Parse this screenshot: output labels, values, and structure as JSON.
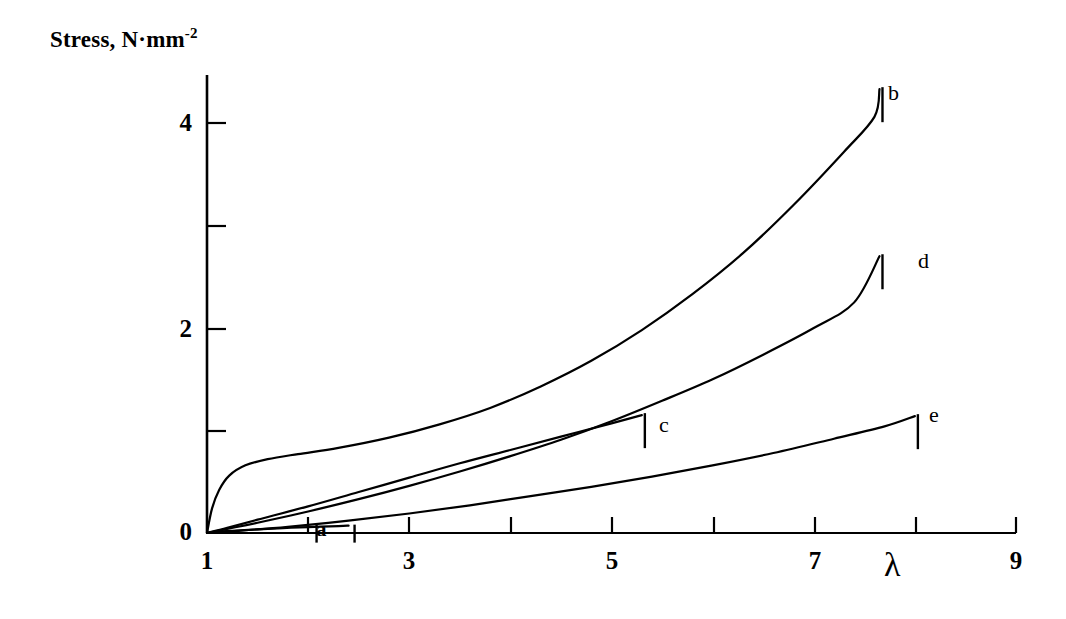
{
  "chart_data": {
    "type": "line",
    "title": "",
    "ylabel": "Stress, N·mm",
    "ylabel_sup": "-2",
    "xlabel": "λ",
    "xlim": [
      1,
      9
    ],
    "ylim": [
      0,
      4.6
    ],
    "grid": false,
    "legend_position": "inline-end-of-curve",
    "x_ticks_major": [
      1,
      3,
      5,
      7,
      9
    ],
    "x_ticks_major_labels": [
      "1",
      "3",
      "5",
      "7",
      "9"
    ],
    "x_ticks_minor": [
      2,
      4,
      6,
      8
    ],
    "y_ticks_major": [
      0,
      2,
      4
    ],
    "y_ticks_major_labels": [
      "0",
      "2",
      "4"
    ],
    "y_ticks_minor": [
      1,
      3
    ],
    "series": [
      {
        "name": "a",
        "label": "a",
        "label_style": "bracketed",
        "points": [
          [
            1.0,
            0.0
          ],
          [
            1.1,
            0.012
          ],
          [
            1.25,
            0.022
          ],
          [
            1.5,
            0.036
          ],
          [
            1.75,
            0.048
          ],
          [
            2.0,
            0.058
          ],
          [
            2.3,
            0.068
          ],
          [
            2.4,
            0.072
          ]
        ]
      },
      {
        "name": "b",
        "label": "b",
        "label_style": "tick",
        "points": [
          [
            1.0,
            0.0
          ],
          [
            1.05,
            0.24
          ],
          [
            1.12,
            0.42
          ],
          [
            1.22,
            0.56
          ],
          [
            1.38,
            0.66
          ],
          [
            1.6,
            0.72
          ],
          [
            1.9,
            0.77
          ],
          [
            2.3,
            0.83
          ],
          [
            2.8,
            0.93
          ],
          [
            3.3,
            1.06
          ],
          [
            3.8,
            1.22
          ],
          [
            4.3,
            1.43
          ],
          [
            4.8,
            1.68
          ],
          [
            5.3,
            1.98
          ],
          [
            5.8,
            2.33
          ],
          [
            6.3,
            2.73
          ],
          [
            6.8,
            3.2
          ],
          [
            7.3,
            3.72
          ],
          [
            7.6,
            4.06
          ],
          [
            7.65,
            4.33
          ]
        ]
      },
      {
        "name": "c",
        "label": "c",
        "label_style": "tick",
        "points": [
          [
            1.0,
            0.0
          ],
          [
            1.2,
            0.05
          ],
          [
            1.5,
            0.13
          ],
          [
            2.0,
            0.26
          ],
          [
            2.5,
            0.4
          ],
          [
            3.0,
            0.54
          ],
          [
            3.5,
            0.68
          ],
          [
            4.0,
            0.81
          ],
          [
            4.5,
            0.94
          ],
          [
            5.0,
            1.07
          ],
          [
            5.3,
            1.15
          ]
        ]
      },
      {
        "name": "d",
        "label": "d",
        "label_style": "tick",
        "points": [
          [
            1.0,
            0.0
          ],
          [
            1.2,
            0.04
          ],
          [
            1.5,
            0.1
          ],
          [
            2.0,
            0.21
          ],
          [
            2.5,
            0.33
          ],
          [
            3.0,
            0.46
          ],
          [
            3.5,
            0.6
          ],
          [
            4.0,
            0.75
          ],
          [
            4.5,
            0.91
          ],
          [
            5.0,
            1.09
          ],
          [
            5.5,
            1.29
          ],
          [
            6.0,
            1.5
          ],
          [
            6.5,
            1.74
          ],
          [
            7.0,
            2.0
          ],
          [
            7.4,
            2.25
          ],
          [
            7.65,
            2.7
          ]
        ]
      },
      {
        "name": "e",
        "label": "e",
        "label_style": "tick",
        "points": [
          [
            1.0,
            0.0
          ],
          [
            1.3,
            0.02
          ],
          [
            1.8,
            0.06
          ],
          [
            2.4,
            0.12
          ],
          [
            3.0,
            0.19
          ],
          [
            3.6,
            0.27
          ],
          [
            4.2,
            0.36
          ],
          [
            4.8,
            0.45
          ],
          [
            5.4,
            0.55
          ],
          [
            6.0,
            0.66
          ],
          [
            6.6,
            0.78
          ],
          [
            7.2,
            0.92
          ],
          [
            7.7,
            1.04
          ],
          [
            8.0,
            1.14
          ]
        ]
      }
    ],
    "colors": {
      "axis": "#000000",
      "curve": "#000000",
      "background": "#ffffff"
    }
  }
}
